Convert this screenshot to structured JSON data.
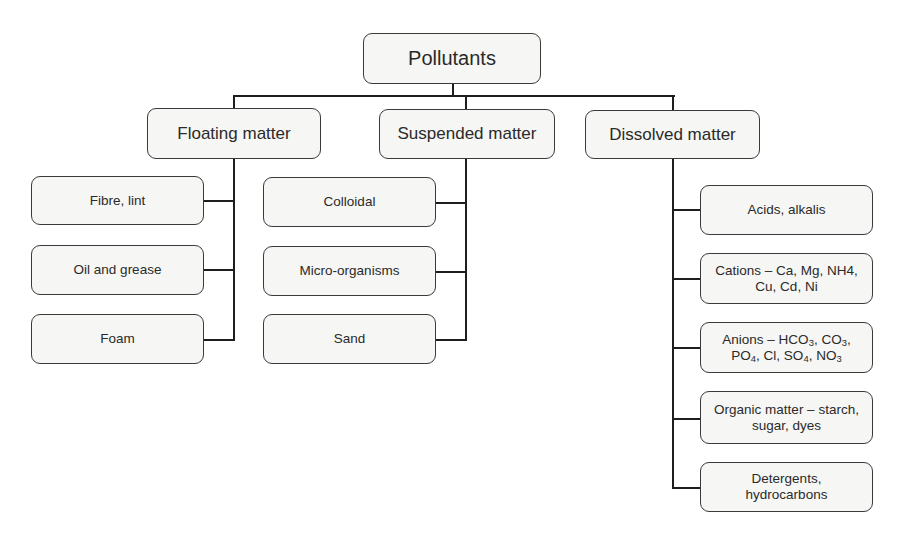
{
  "root": {
    "label": "Pollutants"
  },
  "categories": [
    {
      "label": "Floating matter",
      "children": [
        {
          "label": "Fibre, lint"
        },
        {
          "label": "Oil and grease"
        },
        {
          "label": "Foam"
        }
      ]
    },
    {
      "label": "Suspended matter",
      "children": [
        {
          "label": "Colloidal"
        },
        {
          "label": "Micro-organisms"
        },
        {
          "label": "Sand"
        }
      ]
    },
    {
      "label": "Dissolved matter",
      "children": [
        {
          "label": "Acids, alkalis"
        },
        {
          "line1": "Cations – Ca, Mg, NH4,",
          "line2": "Cu, Cd, Ni"
        },
        {
          "line1_prefix": "Anions – HCO",
          "line1_sub1": "3",
          "line1_mid": ", CO",
          "line1_sub2": "3",
          "line1_end": ",",
          "line2_a": "PO",
          "line2_sub1": "4",
          "line2_b": ", Cl, SO",
          "line2_sub2": "4",
          "line2_c": ", NO",
          "line2_sub3": "3"
        },
        {
          "line1": "Organic matter – starch,",
          "line2": "sugar, dyes"
        },
        {
          "line1": "Detergents,",
          "line2": "hydrocarbons"
        }
      ]
    }
  ],
  "colors": {
    "line": "#1e1e1e",
    "box_border": "#3a3a3a",
    "box_fill": "#f6f6f4",
    "text": "#2a2a2a"
  }
}
